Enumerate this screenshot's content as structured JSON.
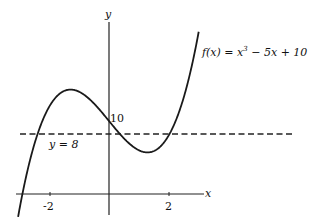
{
  "chart_data": {
    "type": "line",
    "title": "",
    "function_label": "f(x) = x³ − 5x + 10",
    "xlabel": "x",
    "ylabel": "y",
    "x_ticks": [
      {
        "value": -2,
        "label": "-2"
      },
      {
        "value": 2,
        "label": "2"
      }
    ],
    "y_ticks": [
      {
        "value": 10,
        "label": "10"
      }
    ],
    "xlim": [
      -3.0,
      3.3
    ],
    "ylim": [
      -2,
      24
    ],
    "grid": false,
    "series": [
      {
        "name": "f(x) = x^3 - 5x + 10",
        "style": "solid",
        "x": [
          -3.1,
          -3.0,
          -2.5,
          -2.0,
          -1.5,
          -1.29,
          -1.0,
          -0.5,
          0,
          0.5,
          1.0,
          1.29,
          1.5,
          2.0,
          2.5,
          3.0
        ],
        "y": [
          -4.3,
          -2,
          6.9,
          12,
          14.1,
          14.3,
          14,
          12.4,
          10,
          7.6,
          6,
          5.7,
          5.9,
          8,
          13.1,
          22
        ]
      },
      {
        "name": "y = 8",
        "style": "dashed",
        "x": [
          -3.0,
          3.0
        ],
        "y": [
          8,
          8
        ]
      }
    ],
    "annotations": [
      {
        "text": "y = 8",
        "x": -2.4,
        "y": 6.5
      },
      {
        "text": "10",
        "x": 0.05,
        "y": 10.3
      }
    ]
  },
  "labels": {
    "func_prefix": "f(x) = x",
    "func_exp": "3",
    "func_suffix": " − 5x + 10",
    "x_axis": "x",
    "y_axis": "y",
    "tick_neg2": "-2",
    "tick_2": "2",
    "tick_10": "10",
    "hline": "y = 8"
  }
}
